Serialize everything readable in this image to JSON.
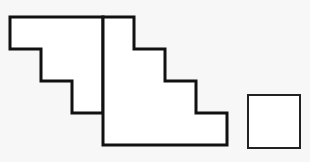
{
  "diagram": {
    "background": "#f7f7f7",
    "stroke_color": "#111111",
    "fill_color": "#ffffff",
    "shapes": [
      {
        "name": "left-staircase",
        "points": "10,17 103,17 103,113 72,113 72,81 41,81 41,49 10,49",
        "stroke_width": 3
      },
      {
        "name": "right-staircase",
        "points": "103,17 134,17 134,49 165,49 165,81 196,81 196,113 227,113 227,145 103,145",
        "stroke_width": 3
      },
      {
        "name": "small-square",
        "x": 248,
        "y": 95,
        "width": 52,
        "height": 53,
        "stroke_width": 2
      }
    ]
  }
}
